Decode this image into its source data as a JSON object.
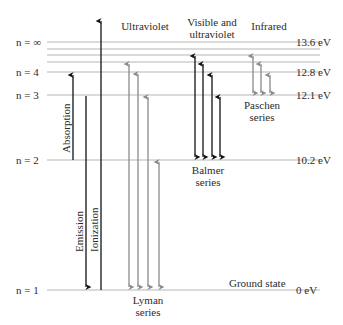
{
  "diagram": {
    "region_labels": {
      "ultraviolet": "Ultraviolet",
      "visible_uv_1": "Visible and",
      "visible_uv_2": "ultraviolet",
      "infrared": "Infrared"
    },
    "levels": [
      {
        "n_label": "n = ∞",
        "energy": "13.6 eV",
        "y": 42
      },
      {
        "n_label": "n = 4",
        "energy": "12.8 eV",
        "y": 72
      },
      {
        "n_label": "n = 3",
        "energy": "12.1 eV",
        "y": 95
      },
      {
        "n_label": "n = 2",
        "energy": "10.2 eV",
        "y": 160
      },
      {
        "n_label": "n = 1",
        "energy": "0 eV",
        "y": 290
      }
    ],
    "extra_level_lines_y": [
      49,
      55,
      62
    ],
    "process_labels": {
      "absorption": "Absorption",
      "emission": "Emission",
      "ionization": "Ionization"
    },
    "series": {
      "lyman": {
        "line1": "Lyman",
        "line2": "series",
        "color": "#8a8a8a"
      },
      "balmer": {
        "line1": "Balmer",
        "line2": "series",
        "color": "#111111"
      },
      "paschen": {
        "line1": "Paschen",
        "line2": "series",
        "color": "#8a8a8a"
      }
    },
    "ground_state": "Ground state",
    "colors": {
      "level_line": "#b5b5b5",
      "black_arrow": "#111111",
      "gray_arrow": "#8a8a8a",
      "text": "#2b2b2b"
    }
  }
}
